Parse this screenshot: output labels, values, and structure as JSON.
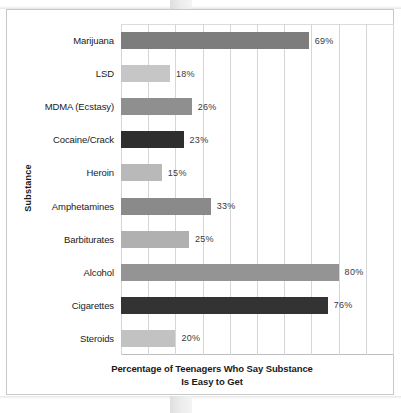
{
  "figure": {
    "y_axis_title": "Substance",
    "x_axis_title_line1": "Percentage of Teenagers Who Say Substance",
    "x_axis_title_line2": "Is Easy to Get"
  },
  "chart_data": {
    "type": "bar",
    "orientation": "horizontal",
    "title": "",
    "xlabel": "Percentage of Teenagers Who Say Substance Is Easy to Get",
    "ylabel": "Substance",
    "xlim": [
      0,
      100
    ],
    "grid": true,
    "grid_axis": "x",
    "gridline_step": 10,
    "legend": "none",
    "value_label_suffix": "%",
    "categories": [
      "Marijuana",
      "LSD",
      "MDMA (Ecstasy)",
      "Cocaine/Crack",
      "Heroin",
      "Amphetamines",
      "Barbiturates",
      "Alcohol",
      "Cigarettes",
      "Steroids"
    ],
    "values": [
      69,
      18,
      26,
      23,
      15,
      33,
      25,
      80,
      76,
      20
    ],
    "value_labels": [
      "69%",
      "18%",
      "26%",
      "23%",
      "15%",
      "33%",
      "25%",
      "80%",
      "76%",
      "20%"
    ],
    "bar_colors": [
      "#7d7d7d",
      "#c6c6c6",
      "#8f8f8f",
      "#2e2e2e",
      "#b9b9b9",
      "#8a8a8a",
      "#b0b0b0",
      "#949494",
      "#333333",
      "#c2c2c2"
    ],
    "bars": [
      {
        "category": "Marijuana",
        "value": 69,
        "label": "69%",
        "color": "#7d7d7d"
      },
      {
        "category": "LSD",
        "value": 18,
        "label": "18%",
        "color": "#c6c6c6"
      },
      {
        "category": "MDMA (Ecstasy)",
        "value": 26,
        "label": "26%",
        "color": "#8f8f8f"
      },
      {
        "category": "Cocaine/Crack",
        "value": 23,
        "label": "23%",
        "color": "#2e2e2e"
      },
      {
        "category": "Heroin",
        "value": 15,
        "label": "15%",
        "color": "#b9b9b9"
      },
      {
        "category": "Amphetamines",
        "value": 33,
        "label": "33%",
        "color": "#8a8a8a"
      },
      {
        "category": "Barbiturates",
        "value": 25,
        "label": "25%",
        "color": "#b0b0b0"
      },
      {
        "category": "Alcohol",
        "value": 80,
        "label": "80%",
        "color": "#949494"
      },
      {
        "category": "Cigarettes",
        "value": 76,
        "label": "76%",
        "color": "#333333"
      },
      {
        "category": "Steroids",
        "value": 20,
        "label": "20%",
        "color": "#c2c2c2"
      }
    ]
  },
  "colors": {
    "gridline": "#d6d6d6",
    "axis": "#bdbdbd",
    "frame": "#c8c8c8",
    "text": "#1a1a1a",
    "value_text": "#3a3a3a",
    "background": "#ffffff"
  }
}
